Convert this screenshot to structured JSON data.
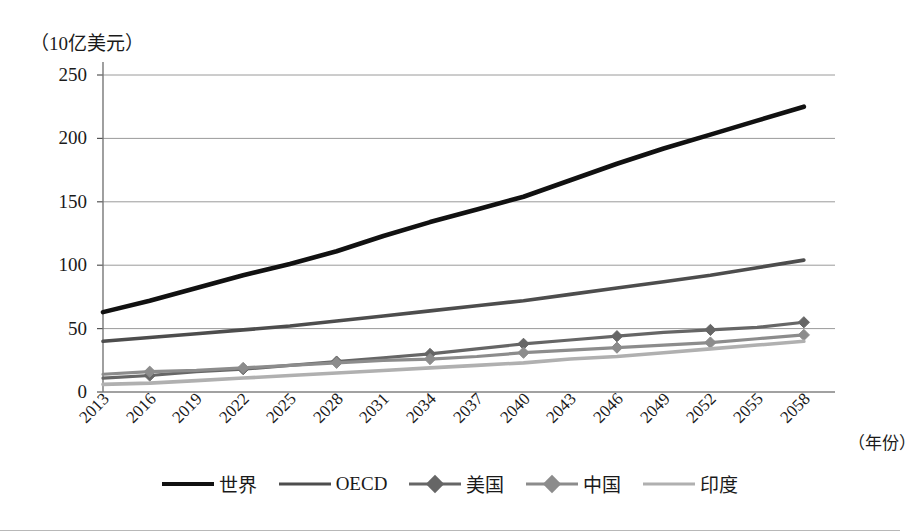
{
  "unit_label": "（10亿美元）",
  "xaxis_title": "（年份）",
  "axis": {
    "y_ticks": [
      "0",
      "50",
      "100",
      "150",
      "200",
      "250"
    ],
    "x_ticks": [
      "2013",
      "2016",
      "2019",
      "2022",
      "2025",
      "2028",
      "2031",
      "2034",
      "2037",
      "2040",
      "2043",
      "2046",
      "2049",
      "2052",
      "2055",
      "2058"
    ]
  },
  "legend": {
    "items": [
      {
        "label": "世界",
        "color": "#111111",
        "width": 4.2,
        "marker": "none"
      },
      {
        "label": "OECD",
        "color": "#4d4d4d",
        "width": 3.4,
        "marker": "none"
      },
      {
        "label": "美国",
        "color": "#666666",
        "width": 3.0,
        "marker": "diamond"
      },
      {
        "label": "中国",
        "color": "#8c8c8c",
        "width": 3.0,
        "marker": "diamond"
      },
      {
        "label": "印度",
        "color": "#b0b0b0",
        "width": 3.4,
        "marker": "none"
      }
    ]
  },
  "chart_data": {
    "type": "line",
    "title": "",
    "subtitle": "",
    "xlabel": "（年份）",
    "ylabel": "（10亿美元）",
    "xlim": [
      2013,
      2060
    ],
    "ylim": [
      0,
      250
    ],
    "grid": true,
    "legend_position": "bottom",
    "x": [
      2013,
      2016,
      2019,
      2022,
      2025,
      2028,
      2031,
      2034,
      2037,
      2040,
      2043,
      2046,
      2049,
      2052,
      2055,
      2058
    ],
    "series": [
      {
        "name": "世界",
        "color": "#111111",
        "marker": "none",
        "values": [
          63,
          72,
          82,
          92,
          101,
          111,
          123,
          134,
          144,
          154,
          167,
          180,
          192,
          203,
          214,
          225
        ]
      },
      {
        "name": "OECD",
        "color": "#4d4d4d",
        "marker": "none",
        "values": [
          40,
          43,
          46,
          49,
          52,
          56,
          60,
          64,
          68,
          72,
          77,
          82,
          87,
          92,
          98,
          104
        ]
      },
      {
        "name": "美国",
        "color": "#666666",
        "marker": "diamond",
        "values": [
          11,
          13,
          16,
          18,
          21,
          24,
          27,
          30,
          34,
          38,
          41,
          44,
          47,
          49,
          51,
          55
        ]
      },
      {
        "name": "中国",
        "color": "#8c8c8c",
        "marker": "diamond",
        "values": [
          14,
          16,
          17,
          19,
          21,
          23,
          25,
          26,
          28,
          31,
          33,
          35,
          37,
          39,
          42,
          45
        ]
      },
      {
        "name": "印度",
        "color": "#b0b0b0",
        "marker": "none",
        "values": [
          6,
          7,
          9,
          11,
          13,
          15,
          17,
          19,
          21,
          23,
          26,
          28,
          31,
          34,
          37,
          40
        ]
      }
    ]
  }
}
